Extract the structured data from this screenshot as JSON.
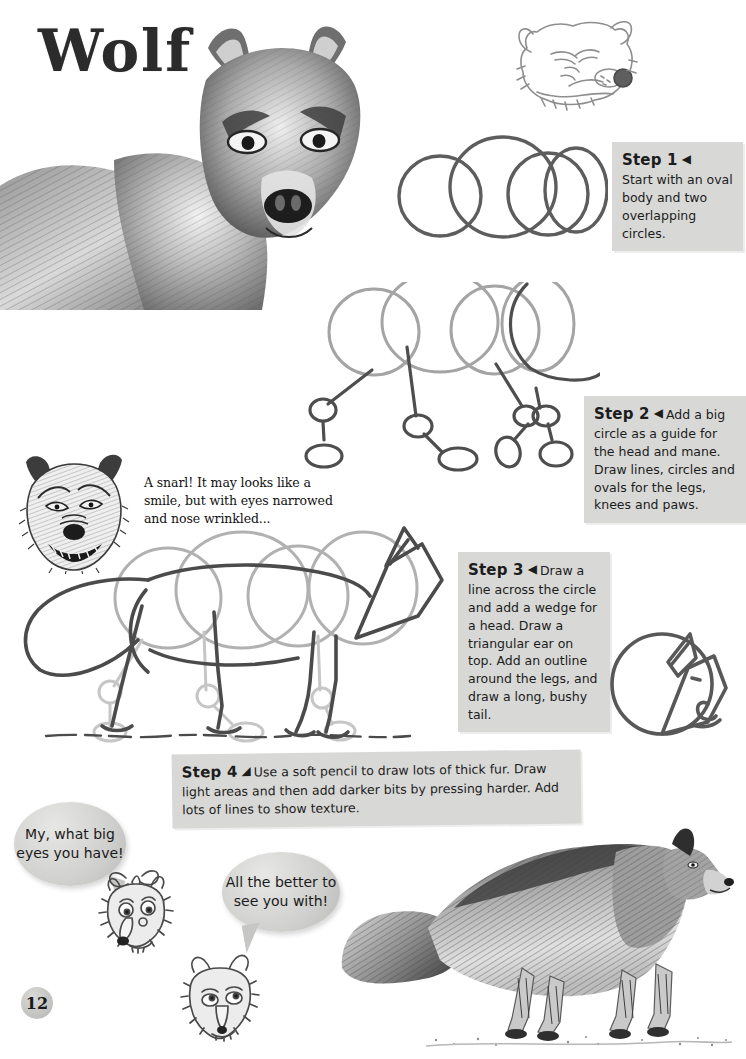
{
  "page": {
    "title": "Wolf",
    "number": "12"
  },
  "callouts": [
    {
      "id": "step1",
      "heading": "Step 1",
      "marker": "◀",
      "body": "Start with an oval body and two overlapping circles."
    },
    {
      "id": "step2",
      "heading": "Step 2",
      "marker": "◀",
      "body": "Add a big circle as a guide for the head and mane. Draw lines, circles and ovals for the legs, knees and paws."
    },
    {
      "id": "step3",
      "heading": "Step 3",
      "marker": "◀",
      "body": "Draw a line across the circle and add a wedge for a head. Draw a triangular ear on top. Add an outline around the legs, and draw a long, bushy tail."
    },
    {
      "id": "step4",
      "heading": "Step 4",
      "marker": "◢",
      "body": "Use a soft pencil to draw lots of thick fur. Draw light areas and then add darker bits by pressing harder. Add lots of lines to show texture."
    }
  ],
  "captions": {
    "snarl": "A snarl! It may looks like a smile, but with eyes narrowed and nose wrinkled..."
  },
  "bubbles": [
    {
      "id": "bubble-1",
      "text": "My, what big eyes you have!"
    },
    {
      "id": "bubble-2",
      "text": "All the better to see you with!"
    }
  ],
  "artwork": [
    {
      "name": "wolf-portrait-photo",
      "caption": "Shaded pencil portrait of a wolf head and shoulders"
    },
    {
      "name": "wolf-face-sketch-top",
      "caption": "Light line sketch of a wolf face"
    },
    {
      "name": "step1-circles-diagram",
      "caption": "Four overlapping circles forming the body guide"
    },
    {
      "name": "step2-skeleton-diagram",
      "caption": "Body circles with stick legs, knee circles and paw ovals"
    },
    {
      "name": "snarling-wolf-head",
      "caption": "Hatched drawing of a snarling wolf head"
    },
    {
      "name": "step3-outline-diagram",
      "caption": "Wolf body outline over construction circles with wedge head and bushy tail"
    },
    {
      "name": "step3-head-detail",
      "caption": "Close up circle showing wedge head and triangular ear"
    },
    {
      "name": "finished-wolf-drawing",
      "caption": "Finished shaded pencil drawing of a walking wolf"
    },
    {
      "name": "cartoon-wolf-grandma",
      "caption": "Cartoon wolf face wearing a bonnet"
    },
    {
      "name": "cartoon-wolf-face",
      "caption": "Cartoon wolf face looking up"
    }
  ],
  "colors": {
    "callout_bg": "#d8d8d6",
    "ink": "#1c1c1c",
    "guide_grey": "#9a9a9a",
    "outline_dark": "#4a4a4a",
    "paper": "#ffffff"
  }
}
